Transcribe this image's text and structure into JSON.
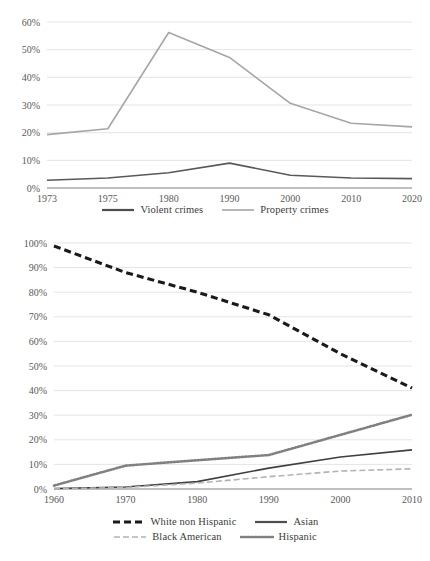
{
  "chart_data": [
    {
      "id": "crimes",
      "type": "line",
      "title": "",
      "xlabel": "",
      "ylabel": "",
      "categories": [
        "1973",
        "1975",
        "1980",
        "1990",
        "2000",
        "2010",
        "2020"
      ],
      "ylim": [
        0,
        60
      ],
      "ytick_labels": [
        "0%",
        "10%",
        "20%",
        "30%",
        "40%",
        "50%",
        "60%"
      ],
      "yticks": [
        0,
        10,
        20,
        30,
        40,
        50,
        60
      ],
      "grid": true,
      "legend_position": "bottom",
      "series": [
        {
          "name": "Violent crimes",
          "style": "solid",
          "color": "#595959",
          "values": [
            2.8,
            3.6,
            5.5,
            9.0,
            4.6,
            3.6,
            3.4
          ]
        },
        {
          "name": "Property crimes",
          "style": "solid",
          "color": "#a6a6a6",
          "values": [
            19.3,
            21.4,
            56.2,
            47.2,
            30.6,
            23.4,
            22.1
          ]
        }
      ]
    },
    {
      "id": "demographics",
      "type": "line",
      "title": "",
      "xlabel": "",
      "ylabel": "",
      "categories": [
        "1960",
        "1970",
        "1980",
        "1990",
        "2000",
        "2010"
      ],
      "ylim": [
        0,
        100
      ],
      "ytick_labels": [
        "0%",
        "10%",
        "20%",
        "30%",
        "40%",
        "50%",
        "60%",
        "70%",
        "80%",
        "90%",
        "100%"
      ],
      "yticks": [
        0,
        10,
        20,
        30,
        40,
        50,
        60,
        70,
        80,
        90,
        100
      ],
      "grid": true,
      "legend_position": "bottom",
      "series": [
        {
          "name": "White non Hispanic",
          "style": "dashed",
          "color": "#1a1a1a",
          "values": [
            98.8,
            88.0,
            80.0,
            70.8,
            55.0,
            41.0
          ]
        },
        {
          "name": "Asian",
          "style": "solid",
          "color": "#404040",
          "values": [
            0.2,
            0.8,
            3.0,
            8.5,
            13.0,
            15.9
          ]
        },
        {
          "name": "Black American",
          "style": "dashdot",
          "color": "#b3b3b3",
          "values": [
            0.1,
            0.6,
            2.4,
            5.0,
            7.3,
            8.2
          ]
        },
        {
          "name": "Hispanic",
          "style": "dotted",
          "color": "#808080",
          "values": [
            1.4,
            9.5,
            11.7,
            13.8,
            22.0,
            30.2
          ]
        }
      ]
    }
  ],
  "top_chart": {
    "legend": [
      {
        "label": "Violent crimes",
        "swatch": "solid-dark"
      },
      {
        "label": "Property crimes",
        "swatch": "solid-light"
      }
    ]
  },
  "bottom_chart": {
    "legend_row1": [
      {
        "label": "White non Hispanic",
        "swatch": "dashed-black"
      },
      {
        "label": "Asian",
        "swatch": "solid-dark"
      }
    ],
    "legend_row2": [
      {
        "label": "Black American",
        "swatch": "dashdot-light"
      },
      {
        "label": "Hispanic",
        "swatch": "dotted-gray"
      }
    ]
  }
}
